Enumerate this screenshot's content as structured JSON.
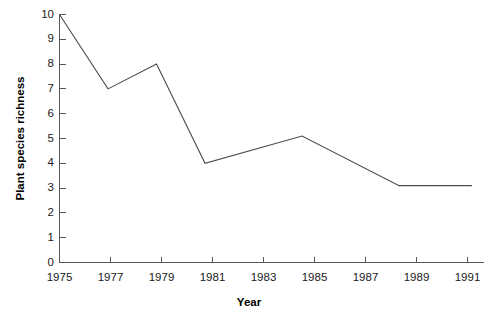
{
  "chart_data": {
    "type": "line",
    "title": "",
    "xlabel": "Year",
    "ylabel": "Plant species richness",
    "x": [
      1975,
      1977,
      1979,
      1981,
      1985,
      1989,
      1992
    ],
    "values": [
      10,
      7,
      8,
      4,
      5.1,
      3.1,
      3.1
    ],
    "series": [
      {
        "name": "Plant species richness",
        "values": [
          10,
          7,
          8,
          4,
          5.1,
          3.1,
          3.1
        ],
        "color": "#4a4a4c"
      }
    ],
    "xlim": [
      1975,
      1992.5
    ],
    "ylim": [
      0,
      10
    ],
    "ytick_labels": [
      "0",
      "1",
      "2",
      "3",
      "4",
      "5",
      "6",
      "7",
      "8",
      "9",
      "10"
    ],
    "ytick_values": [
      0,
      1,
      2,
      3,
      4,
      5,
      6,
      7,
      8,
      9,
      10
    ],
    "xtick_labels": [
      "1975",
      "1977",
      "1979",
      "1981",
      "1983",
      "1985",
      "1987",
      "1989",
      "1991"
    ],
    "xtick_values": [
      1975,
      1977,
      1979,
      1981,
      1983,
      1985,
      1987,
      1989,
      1991
    ],
    "grid": false,
    "legend": false,
    "legend_position": "none",
    "markers": false,
    "annotations": []
  },
  "axes": {
    "y_title": "Plant species richness",
    "x_title": "Year"
  },
  "colors": {
    "line": "#4a4a4c",
    "axis": "#58585a",
    "text": "#1a1a1a",
    "background": "#ffffff"
  },
  "artifact": {
    "bottom_cut_text": ". .  . . .   . .   .. ..   ... ..   .."
  }
}
